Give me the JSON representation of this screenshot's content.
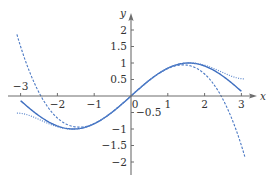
{
  "chart_data": {
    "type": "line",
    "title": "",
    "xlabel": "x",
    "ylabel": "y",
    "xlim": [
      -3.1,
      3.1
    ],
    "ylim": [
      -2.0,
      2.0
    ],
    "grid": false,
    "legend": null,
    "x_ticks": [
      -3,
      -2,
      -1,
      0,
      1,
      2,
      3
    ],
    "x_tick_labels": [
      "−3",
      "−2",
      "−1",
      "0",
      "1",
      "2",
      "3"
    ],
    "y_ticks": [
      2,
      1.5,
      1,
      0.5,
      -0.5,
      -1,
      -1.5,
      -2
    ],
    "y_tick_labels": [
      "2",
      "1.5",
      "1",
      "0.5",
      "−0.5",
      "−1",
      "−1.5",
      "−2"
    ],
    "series": [
      {
        "name": "sin x",
        "style": "solid",
        "color": "#3f6fc0",
        "x": [
          -3.0,
          -2.5,
          -2.0,
          -1.5708,
          -1.0,
          -0.5,
          0.0,
          0.5,
          1.0,
          1.5708,
          2.0,
          2.5,
          3.0
        ],
        "y": [
          -0.141,
          -0.598,
          -0.909,
          -1.0,
          -0.841,
          -0.479,
          0.0,
          0.479,
          0.841,
          1.0,
          0.909,
          0.598,
          0.141
        ]
      },
      {
        "name": "x − x³/6",
        "style": "dashed",
        "color": "#4a78c4",
        "x": [
          -3.1,
          -3.0,
          -2.5,
          -2.0,
          -1.414,
          -1.0,
          -0.5,
          0.0,
          0.5,
          1.0,
          1.414,
          2.0,
          2.5,
          3.0,
          3.1
        ],
        "y": [
          1.865,
          1.5,
          0.104,
          -0.667,
          -0.943,
          -0.833,
          -0.479,
          0.0,
          0.479,
          0.833,
          0.943,
          0.667,
          -0.104,
          -1.5,
          -1.865
        ]
      },
      {
        "name": "x − x³/6 + x⁵/120",
        "style": "dotted",
        "color": "#5a86cc",
        "x": [
          -3.1,
          -3.0,
          -2.5,
          -2.0,
          -1.5,
          -1.0,
          -0.5,
          0.0,
          0.5,
          1.0,
          1.5,
          2.0,
          2.5,
          3.0,
          3.1
        ],
        "y": [
          -0.521,
          -0.525,
          -0.918,
          -0.933,
          -0.998,
          -0.842,
          -0.479,
          0.0,
          0.479,
          0.842,
          0.998,
          0.933,
          0.918,
          0.525,
          0.521
        ]
      }
    ]
  },
  "layout": {
    "origin_px": [
      131,
      96
    ],
    "px_per_unit_x": 36.8,
    "px_per_unit_y": 33.0
  }
}
